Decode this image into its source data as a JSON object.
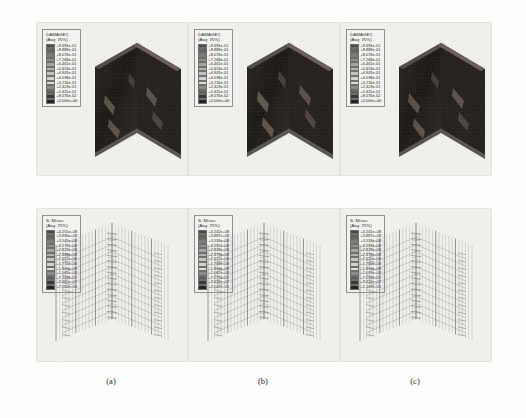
{
  "figure": {
    "background_color": "#fdfdfb",
    "panel_background": "#f0efeb",
    "rows": 2,
    "columns": 3
  },
  "captions": [
    {
      "label": "(a)"
    },
    {
      "label": "(b)"
    },
    {
      "label": "(c)"
    }
  ],
  "legends": {
    "damagec_a": {
      "title": "DAMAGEC",
      "subtitle": "(Avg: 75%)",
      "values": [
        "+9.691e-01",
        "+8.883e-01",
        "+8.076e-01",
        "+7.268e-01",
        "+6.461e-01",
        "+5.653e-01",
        "+4.845e-01",
        "+4.038e-01",
        "+3.230e-01",
        "+2.423e-01",
        "+1.615e-01",
        "+8.076e-02",
        "+0.000e+00"
      ]
    },
    "damagec_b": {
      "title": "DAMAGEC",
      "subtitle": "(Avg: 75%)",
      "values": [
        "+9.691e-01",
        "+8.883e-01",
        "+8.076e-01",
        "+7.268e-01",
        "+6.461e-01",
        "+5.653e-01",
        "+4.845e-01",
        "+4.038e-01",
        "+3.230e-01",
        "+2.423e-01",
        "+1.615e-01",
        "+8.076e-02",
        "+0.000e+00"
      ]
    },
    "damagec_c": {
      "title": "DAMAGEC",
      "subtitle": "(Avg: 75%)",
      "values": [
        "+9.691e-01",
        "+8.883e-01",
        "+8.076e-01",
        "+7.268e-01",
        "+6.461e-01",
        "+5.653e-01",
        "+4.845e-01",
        "+4.038e-01",
        "+3.230e-01",
        "+2.423e-01",
        "+1.615e-01",
        "+8.076e-02",
        "+0.000e+00"
      ]
    },
    "mises_a": {
      "title": "S, Mises",
      "subtitle": "(Avg: 75%)",
      "values": [
        "+4.255e+08",
        "+3.930e+08",
        "+3.545e+08",
        "+3.179e+08",
        "+2.823e+08",
        "+2.468e+08",
        "+2.112e+08",
        "+1.775e+08",
        "+1.420e+08",
        "+1.065e+08",
        "+7.103e+07",
        "+3.565e+07",
        "+7.250e+06"
      ]
    },
    "mises_b": {
      "title": "S, Mises",
      "subtitle": "(Avg: 75%)",
      "values": [
        "+4.242e+08",
        "+3.887e+08",
        "+3.533e+08",
        "+3.182e+08",
        "+2.828e+08",
        "+2.473e+08",
        "+2.122e+08",
        "+1.768e+08",
        "+1.414e+08",
        "+1.062e+08",
        "+7.075e+07",
        "+3.539e+07",
        "+2.042e+05"
      ]
    },
    "mises_c": {
      "title": "S, Mises",
      "subtitle": "(Avg: 75%)",
      "values": [
        "+4.241e+08",
        "+3.887e+08",
        "+3.533e+08",
        "+3.183e+08",
        "+2.828e+08",
        "+2.474e+08",
        "+2.120e+08",
        "+1.766e+08",
        "+1.413e+08",
        "+1.059e+08",
        "+7.058e+07",
        "+3.526e+07",
        "+1.169e+05"
      ]
    }
  },
  "colors": {
    "ramp": [
      "#4b4b4b",
      "#636363",
      "#7b7b7b",
      "#8f8f8f",
      "#a3a3a3",
      "#b4b4b4",
      "#c4c4c4",
      "#d2d2d2",
      "#dedede",
      "#8a8a8a",
      "#5e5e5e",
      "#3a3a3a",
      "#242424"
    ],
    "mesh_dark": "#231f1d",
    "mesh_mid": "#3a3431",
    "damage_streak": "#8d8379",
    "rebar_line": "#8c8c8c",
    "rebar_dark": "#5d5d5d"
  },
  "models": {
    "top_row": {
      "type": "solid-chevron-mesh",
      "description": "DAMAGEC contour on L-shaped (chevron) reinforced concrete wall"
    },
    "bottom_row": {
      "type": "rebar-cage-wireframe",
      "description": "S, Mises stress on embedded reinforcement cage"
    }
  }
}
